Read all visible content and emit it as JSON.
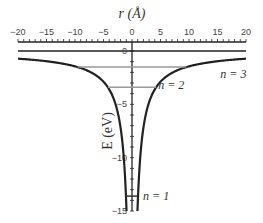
{
  "chart_data": {
    "type": "line",
    "title": "",
    "xlabel": "r (Å)",
    "ylabel": "E (eV)",
    "xlim": [
      -20,
      20
    ],
    "ylim": [
      -15,
      0
    ],
    "x_ticks": [
      -20,
      -15,
      -10,
      -5,
      0,
      5,
      10,
      15,
      20
    ],
    "y_ticks": [
      0,
      -5,
      -10,
      -15
    ],
    "series": [
      {
        "name": "Coulomb potential",
        "formula": "E = -14.4/|r|",
        "color": "#222222"
      }
    ],
    "energy_levels": [
      {
        "label": "n = 1",
        "energy": -13.6
      },
      {
        "label": "n = 2",
        "energy": -3.4
      },
      {
        "label": "n = 3",
        "energy": -1.51
      }
    ],
    "grid": false
  },
  "labels": {
    "x_axis": "r (Å)",
    "y_axis": "E (eV)",
    "x_tick_labels": [
      "−20",
      "−15",
      "−10",
      "−5",
      "0",
      "5",
      "10",
      "15",
      "20"
    ],
    "y_tick_labels": [
      "0",
      "−5",
      "−10",
      "−15"
    ],
    "n1": "n = 1",
    "n2": "n = 2",
    "n3": "n = 3"
  }
}
